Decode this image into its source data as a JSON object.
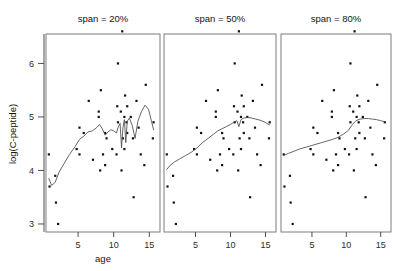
{
  "chart_data": {
    "type": "scatter",
    "title": "",
    "xlabel": "age",
    "ylabel": "log(C-peptide)",
    "xlim": [
      0.5,
      16.5
    ],
    "ylim": [
      2.85,
      6.55
    ],
    "xticks": [
      5,
      10,
      15
    ],
    "yticks": [
      3,
      4,
      5,
      6
    ],
    "grid": false,
    "legend": "none",
    "panel_variable": "span",
    "panels": [
      {
        "label": "span = 20%",
        "span": 0.2,
        "points": [
          [
            5.2,
            4.8
          ],
          [
            8.8,
            4.1
          ],
          [
            10.5,
            5.2
          ],
          [
            10.6,
            6.0
          ],
          [
            10.4,
            4.3
          ],
          [
            1.8,
            3.9
          ],
          [
            12.7,
            4.6
          ],
          [
            15.6,
            4.9
          ],
          [
            5.8,
            4.7
          ],
          [
            1.9,
            3.4
          ],
          [
            2.2,
            3.0
          ],
          [
            4.8,
            4.4
          ],
          [
            7.9,
            5.0
          ],
          [
            5.2,
            4.3
          ],
          [
            0.9,
            4.3
          ],
          [
            11.8,
            4.9
          ],
          [
            7.9,
            5.1
          ],
          [
            11.5,
            5.0
          ],
          [
            10.6,
            4.9
          ],
          [
            8.5,
            4.3
          ],
          [
            11.1,
            4.0
          ],
          [
            12.8,
            3.5
          ],
          [
            11.3,
            4.6
          ],
          [
            1.0,
            3.7
          ],
          [
            14.5,
            5.6
          ],
          [
            11.9,
            5.2
          ],
          [
            8.1,
            4.0
          ],
          [
            13.8,
            4.3
          ],
          [
            15.5,
            4.6
          ],
          [
            9.8,
            4.4
          ],
          [
            11.0,
            5.1
          ],
          [
            12.4,
            5.0
          ],
          [
            8.8,
            4.7
          ],
          [
            7.1,
            4.2
          ],
          [
            11.2,
            6.6
          ],
          [
            6.5,
            5.3
          ],
          [
            8.2,
            5.5
          ],
          [
            13.2,
            5.3
          ],
          [
            11.6,
            5.4
          ],
          [
            11.9,
            4.7
          ],
          [
            9.0,
            4.6
          ],
          [
            11.5,
            4.4
          ],
          [
            14.3,
            4.1
          ],
          [
            13.5,
            4.8
          ]
        ],
        "curve": [
          [
            0.9,
            3.85
          ],
          [
            1.3,
            3.72
          ],
          [
            1.8,
            3.78
          ],
          [
            2.3,
            3.96
          ],
          [
            3.0,
            4.12
          ],
          [
            3.8,
            4.3
          ],
          [
            4.6,
            4.45
          ],
          [
            5.2,
            4.58
          ],
          [
            5.8,
            4.64
          ],
          [
            6.4,
            4.72
          ],
          [
            7.0,
            4.74
          ],
          [
            7.6,
            4.8
          ],
          [
            8.0,
            4.86
          ],
          [
            8.4,
            4.78
          ],
          [
            8.8,
            4.66
          ],
          [
            9.2,
            4.72
          ],
          [
            9.6,
            4.76
          ],
          [
            10.0,
            4.74
          ],
          [
            10.4,
            4.7
          ],
          [
            10.6,
            4.8
          ],
          [
            10.9,
            4.88
          ],
          [
            11.1,
            4.42
          ],
          [
            11.3,
            4.8
          ],
          [
            11.5,
            4.95
          ],
          [
            11.7,
            4.52
          ],
          [
            11.9,
            4.92
          ],
          [
            12.2,
            4.98
          ],
          [
            12.6,
            4.84
          ],
          [
            13.0,
            4.6
          ],
          [
            13.4,
            4.92
          ],
          [
            13.9,
            5.1
          ],
          [
            14.4,
            5.22
          ],
          [
            14.9,
            5.14
          ],
          [
            15.3,
            4.92
          ],
          [
            15.6,
            4.76
          ]
        ]
      },
      {
        "label": "span = 50%",
        "span": 0.5,
        "points": [
          [
            5.2,
            4.8
          ],
          [
            8.8,
            4.1
          ],
          [
            10.5,
            5.2
          ],
          [
            10.6,
            6.0
          ],
          [
            10.4,
            4.3
          ],
          [
            1.8,
            3.9
          ],
          [
            12.7,
            4.6
          ],
          [
            15.6,
            4.9
          ],
          [
            5.8,
            4.7
          ],
          [
            1.9,
            3.4
          ],
          [
            2.2,
            3.0
          ],
          [
            4.8,
            4.4
          ],
          [
            7.9,
            5.0
          ],
          [
            5.2,
            4.3
          ],
          [
            0.9,
            4.3
          ],
          [
            11.8,
            4.9
          ],
          [
            7.9,
            5.1
          ],
          [
            11.5,
            5.0
          ],
          [
            10.6,
            4.9
          ],
          [
            8.5,
            4.3
          ],
          [
            11.1,
            4.0
          ],
          [
            12.8,
            3.5
          ],
          [
            11.3,
            4.6
          ],
          [
            1.0,
            3.7
          ],
          [
            14.5,
            5.6
          ],
          [
            11.9,
            5.2
          ],
          [
            8.1,
            4.0
          ],
          [
            13.8,
            4.3
          ],
          [
            15.5,
            4.6
          ],
          [
            9.8,
            4.4
          ],
          [
            11.0,
            5.1
          ],
          [
            12.4,
            5.0
          ],
          [
            8.8,
            4.7
          ],
          [
            7.1,
            4.2
          ],
          [
            11.2,
            6.6
          ],
          [
            6.5,
            5.3
          ],
          [
            8.2,
            5.5
          ],
          [
            13.2,
            5.3
          ],
          [
            11.6,
            5.4
          ],
          [
            11.9,
            4.7
          ],
          [
            9.0,
            4.6
          ],
          [
            11.5,
            4.4
          ],
          [
            14.3,
            4.1
          ],
          [
            13.5,
            4.8
          ]
        ],
        "curve": [
          [
            0.9,
            4.02
          ],
          [
            1.4,
            4.1
          ],
          [
            2.0,
            4.16
          ],
          [
            2.8,
            4.22
          ],
          [
            3.6,
            4.28
          ],
          [
            4.4,
            4.34
          ],
          [
            5.2,
            4.42
          ],
          [
            6.0,
            4.52
          ],
          [
            6.8,
            4.6
          ],
          [
            7.6,
            4.68
          ],
          [
            8.2,
            4.74
          ],
          [
            8.8,
            4.78
          ],
          [
            9.4,
            4.82
          ],
          [
            10.0,
            4.86
          ],
          [
            10.5,
            4.9
          ],
          [
            10.9,
            4.93
          ],
          [
            11.2,
            4.82
          ],
          [
            11.5,
            4.95
          ],
          [
            11.9,
            4.98
          ],
          [
            12.4,
            4.99
          ],
          [
            13.0,
            4.98
          ],
          [
            13.6,
            4.96
          ],
          [
            14.2,
            4.94
          ],
          [
            14.8,
            4.91
          ],
          [
            15.2,
            4.88
          ],
          [
            15.6,
            4.85
          ]
        ]
      },
      {
        "label": "span = 80%",
        "span": 0.8,
        "points": [
          [
            5.2,
            4.8
          ],
          [
            8.8,
            4.1
          ],
          [
            10.5,
            5.2
          ],
          [
            10.6,
            6.0
          ],
          [
            10.4,
            4.3
          ],
          [
            1.8,
            3.9
          ],
          [
            12.7,
            4.6
          ],
          [
            15.6,
            4.9
          ],
          [
            5.8,
            4.7
          ],
          [
            1.9,
            3.4
          ],
          [
            2.2,
            3.0
          ],
          [
            4.8,
            4.4
          ],
          [
            7.9,
            5.0
          ],
          [
            5.2,
            4.3
          ],
          [
            0.9,
            4.3
          ],
          [
            11.8,
            4.9
          ],
          [
            7.9,
            5.1
          ],
          [
            11.5,
            5.0
          ],
          [
            10.6,
            4.9
          ],
          [
            8.5,
            4.3
          ],
          [
            11.1,
            4.0
          ],
          [
            12.8,
            3.5
          ],
          [
            11.3,
            4.6
          ],
          [
            1.0,
            3.7
          ],
          [
            14.5,
            5.6
          ],
          [
            11.9,
            5.2
          ],
          [
            8.1,
            4.0
          ],
          [
            13.8,
            4.3
          ],
          [
            15.5,
            4.6
          ],
          [
            9.8,
            4.4
          ],
          [
            11.0,
            5.1
          ],
          [
            12.4,
            5.0
          ],
          [
            8.8,
            4.7
          ],
          [
            7.1,
            4.2
          ],
          [
            11.2,
            6.6
          ],
          [
            6.5,
            5.3
          ],
          [
            8.2,
            5.5
          ],
          [
            13.2,
            5.3
          ],
          [
            11.6,
            5.4
          ],
          [
            11.9,
            4.7
          ],
          [
            9.0,
            4.6
          ],
          [
            11.5,
            4.4
          ],
          [
            14.3,
            4.1
          ],
          [
            13.5,
            4.8
          ]
        ],
        "curve": [
          [
            0.9,
            4.28
          ],
          [
            1.6,
            4.32
          ],
          [
            2.4,
            4.36
          ],
          [
            3.2,
            4.4
          ],
          [
            4.0,
            4.43
          ],
          [
            4.8,
            4.46
          ],
          [
            5.6,
            4.49
          ],
          [
            6.4,
            4.52
          ],
          [
            7.2,
            4.55
          ],
          [
            8.0,
            4.58
          ],
          [
            8.8,
            4.62
          ],
          [
            9.6,
            4.68
          ],
          [
            10.3,
            4.75
          ],
          [
            10.9,
            4.86
          ],
          [
            11.4,
            4.93
          ],
          [
            12.0,
            4.96
          ],
          [
            12.6,
            4.97
          ],
          [
            13.2,
            4.97
          ],
          [
            13.8,
            4.96
          ],
          [
            14.4,
            4.95
          ],
          [
            15.0,
            4.93
          ],
          [
            15.6,
            4.91
          ]
        ]
      }
    ]
  }
}
